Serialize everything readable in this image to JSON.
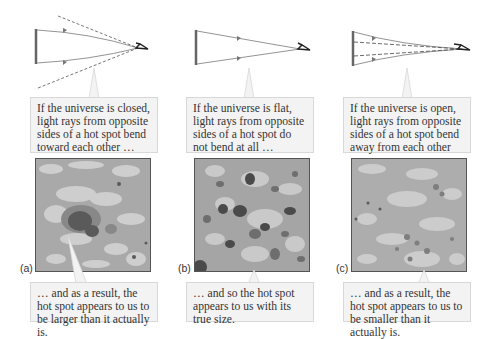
{
  "panels": [
    {
      "id": "a",
      "label": "(a)",
      "geometry": "closed",
      "top_text": "If the universe is closed, light rays from opposite sides of a hot spot bend toward each other …",
      "bottom_text": "… and as a result, the hot spot appears to us to be larger than it actually is."
    },
    {
      "id": "b",
      "label": "(b)",
      "geometry": "flat",
      "top_text": "If the universe is flat, light rays from opposite sides of a hot spot do not bend at all …",
      "bottom_text": "… and so the hot spot appears to us with its true size."
    },
    {
      "id": "c",
      "label": "(c)",
      "geometry": "open",
      "top_text": "If the universe is open, light rays from opposite sides of a hot spot bend away from each other …",
      "bottom_text": "… and as a result, the hot spot appears to us to be smaller than it actually is."
    }
  ],
  "icons": {
    "eye": "eye-icon",
    "source": "hot-spot-bar"
  },
  "colors": {
    "callout_bg": "#f3f3f3",
    "callout_border": "#d8d8d8",
    "map_base": "#a9a9a9",
    "map_light": "#d6d6d6",
    "map_dark": "#4a4a4a",
    "ray": "#777777"
  }
}
